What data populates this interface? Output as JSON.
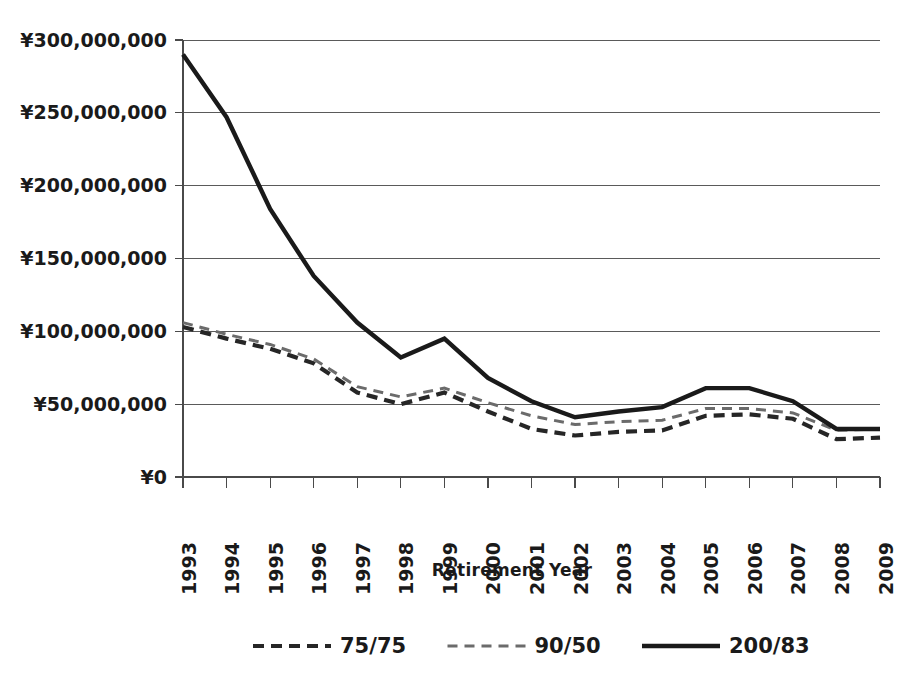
{
  "chart_data": {
    "type": "line",
    "title": "",
    "xlabel": "Retirement Year",
    "ylabel": "",
    "grid": true,
    "legend_position": "bottom",
    "currency_symbol": "¥",
    "ylim": [
      0,
      300000000
    ],
    "ytick_step": 50000000,
    "ytick_labels": [
      "¥300,000,000",
      "¥250,000,000",
      "¥200,000,000",
      "¥150,000,000",
      "¥100,000,000",
      "¥50,000,000",
      "¥0"
    ],
    "ytick_values": [
      300000000,
      250000000,
      200000000,
      150000000,
      100000000,
      50000000,
      0
    ],
    "categories": [
      "1993",
      "1994",
      "1995",
      "1996",
      "1997",
      "1998",
      "1999",
      "2000",
      "2001",
      "2002",
      "2003",
      "2004",
      "2005",
      "2006",
      "2007",
      "2008",
      "2009"
    ],
    "x": [
      1993,
      1994,
      1995,
      1996,
      1997,
      1998,
      1999,
      2000,
      2001,
      2002,
      2003,
      2004,
      2005,
      2006,
      2007,
      2008,
      2009
    ],
    "series": [
      {
        "name": "75/75",
        "style": "dashed",
        "color": "#262626",
        "width": 4.2,
        "dash": "11,7",
        "values": [
          103000000,
          95000000,
          88000000,
          78000000,
          58000000,
          50000000,
          58000000,
          45000000,
          33000000,
          28500000,
          31000000,
          32000000,
          42000000,
          43000000,
          40000000,
          26000000,
          27000000
        ]
      },
      {
        "name": "90/50",
        "style": "dashed",
        "color": "#6b6b6b",
        "width": 3.0,
        "dash": "10,7",
        "values": [
          106000000,
          98000000,
          91000000,
          81000000,
          62000000,
          55000000,
          61000000,
          51000000,
          42000000,
          36000000,
          38000000,
          39000000,
          47000000,
          47000000,
          44000000,
          32000000,
          33000000
        ]
      },
      {
        "name": "200/83",
        "style": "solid",
        "color": "#1a1a1a",
        "width": 4.4,
        "dash": "",
        "values": [
          290000000,
          247000000,
          184000000,
          138000000,
          106000000,
          82000000,
          95000000,
          68000000,
          52000000,
          41000000,
          45000000,
          48000000,
          61000000,
          61000000,
          52000000,
          33000000,
          33000000
        ]
      }
    ],
    "legend_entries": [
      {
        "label": "75/75",
        "style": "dashed",
        "color": "#262626",
        "width": 4.2,
        "dash": "11,7"
      },
      {
        "label": "90/50",
        "style": "dashed",
        "color": "#6b6b6b",
        "width": 3.0,
        "dash": "10,7"
      },
      {
        "label": "200/83",
        "style": "solid",
        "color": "#1a1a1a",
        "width": 4.4,
        "dash": ""
      }
    ]
  },
  "plot": {
    "left": 183,
    "right": 880,
    "top": 40,
    "bottom": 477
  }
}
